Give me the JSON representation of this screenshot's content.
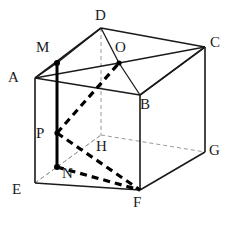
{
  "figure": {
    "name": "cube-with-inscribed-path",
    "type": "geometry-diagram",
    "width": 246,
    "height": 237,
    "background_color": "#ffffff",
    "solid_name": "ABCD-EFGH"
  },
  "colors": {
    "solid_edge": "#1a1a1a",
    "hidden_edge": "#9a9a9a",
    "emphasis": "#000000",
    "label": "#1a1a1a",
    "point_fill": "#000000"
  },
  "vertices": [
    {
      "id": "A",
      "label": "A",
      "x": 35,
      "y": 78,
      "label_x": 8,
      "label_y": 70,
      "kind": "cube-vertex"
    },
    {
      "id": "B",
      "label": "B",
      "x": 140,
      "y": 95,
      "label_x": 140,
      "label_y": 97,
      "kind": "cube-vertex"
    },
    {
      "id": "C",
      "label": "C",
      "x": 205,
      "y": 47,
      "label_x": 210,
      "label_y": 35,
      "kind": "cube-vertex"
    },
    {
      "id": "D",
      "label": "D",
      "x": 101,
      "y": 28,
      "label_x": 95,
      "label_y": 8,
      "kind": "cube-vertex"
    },
    {
      "id": "E",
      "label": "E",
      "x": 35,
      "y": 183,
      "label_x": 12,
      "label_y": 182,
      "kind": "cube-vertex"
    },
    {
      "id": "F",
      "label": "F",
      "x": 140,
      "y": 190,
      "label_x": 133,
      "label_y": 195,
      "kind": "cube-vertex"
    },
    {
      "id": "G",
      "label": "G",
      "x": 205,
      "y": 152,
      "label_x": 209,
      "label_y": 143,
      "kind": "cube-vertex"
    },
    {
      "id": "H",
      "label": "H",
      "x": 101,
      "y": 135,
      "label_x": 96,
      "label_y": 139,
      "kind": "cube-vertex-hidden"
    },
    {
      "id": "M",
      "label": "M",
      "x": 57,
      "y": 63,
      "label_x": 36,
      "label_y": 40,
      "kind": "marked-point"
    },
    {
      "id": "N",
      "label": "N",
      "x": 57,
      "y": 167,
      "label_x": 62,
      "label_y": 166,
      "kind": "marked-point"
    },
    {
      "id": "O",
      "label": "O",
      "x": 119,
      "y": 63,
      "label_x": 115,
      "label_y": 40,
      "kind": "marked-point"
    },
    {
      "id": "P",
      "label": "P",
      "x": 57,
      "y": 133,
      "label_x": 36,
      "label_y": 126,
      "kind": "marked-point"
    }
  ],
  "edges": {
    "visible": [
      {
        "name": "edge-A-B",
        "from": "A",
        "to": "B"
      },
      {
        "name": "edge-A-D",
        "from": "A",
        "to": "D"
      },
      {
        "name": "edge-A-E",
        "from": "A",
        "to": "E"
      },
      {
        "name": "edge-B-C",
        "from": "B",
        "to": "C"
      },
      {
        "name": "edge-B-F",
        "from": "B",
        "to": "F"
      },
      {
        "name": "edge-C-D",
        "from": "C",
        "to": "D"
      },
      {
        "name": "edge-C-G",
        "from": "C",
        "to": "G"
      },
      {
        "name": "edge-E-F",
        "from": "E",
        "to": "F"
      },
      {
        "name": "edge-F-G",
        "from": "F",
        "to": "G"
      }
    ],
    "hidden": [
      {
        "name": "edge-D-H",
        "from": "D",
        "to": "H"
      },
      {
        "name": "edge-E-H",
        "from": "E",
        "to": "H"
      },
      {
        "name": "edge-H-G",
        "from": "H",
        "to": "G"
      }
    ]
  },
  "construction_lines": [
    {
      "name": "line-A-O",
      "from": "A",
      "to": "O",
      "style": "solid"
    },
    {
      "name": "line-D-O",
      "from": "D",
      "to": "O",
      "style": "solid"
    },
    {
      "name": "line-C-O",
      "from": "C",
      "to": "O",
      "style": "solid"
    },
    {
      "name": "line-B-O",
      "from": "B",
      "to": "O",
      "style": "solid"
    },
    {
      "name": "line-M-D",
      "from": "M",
      "to": "D",
      "style": "solid"
    },
    {
      "name": "line-A-M",
      "from": "A",
      "to": "M",
      "style": "solid"
    },
    {
      "name": "line-E-N",
      "from": "E",
      "to": "N",
      "style": "hidden-thin"
    },
    {
      "name": "line-N-H",
      "from": "N",
      "to": "H",
      "style": "hidden-thin"
    }
  ],
  "emphasized": {
    "segments_solid": [
      {
        "name": "segment-M-N",
        "from": "M",
        "to": "N",
        "description": "thick vertical segment through P"
      }
    ],
    "segments_dashed": [
      {
        "name": "segment-P-O",
        "from": "P",
        "to": "O",
        "description": "thick dashed"
      },
      {
        "name": "segment-P-F",
        "from": "P",
        "to": "F",
        "description": "thick dashed"
      },
      {
        "name": "segment-N-F",
        "from": "N",
        "to": "F",
        "description": "thick dashed"
      },
      {
        "name": "segment-O-F",
        "from": "O",
        "to": "F",
        "description": "thick dashed partial toward B"
      }
    ]
  },
  "marked_dots": [
    {
      "name": "dot-M",
      "at": "M"
    },
    {
      "name": "dot-N",
      "at": "N"
    },
    {
      "name": "dot-O",
      "at": "O"
    },
    {
      "name": "dot-P",
      "at": "P"
    }
  ]
}
